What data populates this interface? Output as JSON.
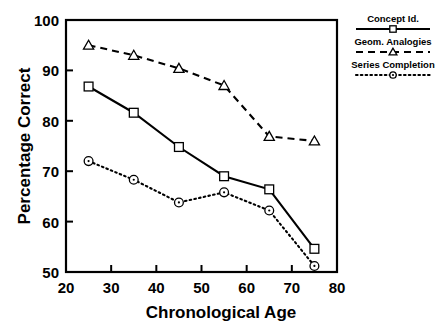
{
  "chart_data": {
    "type": "line",
    "title": "",
    "xlabel": "Chronological Age",
    "ylabel": "Percentage Correct",
    "xlim": [
      20,
      80
    ],
    "ylim": [
      50,
      100
    ],
    "xticks": [
      20,
      30,
      40,
      50,
      60,
      70,
      80
    ],
    "yticks": [
      50,
      60,
      70,
      80,
      90,
      100
    ],
    "xtick_labels": [
      "20",
      "30",
      "40",
      "50",
      "60",
      "70",
      "80"
    ],
    "ytick_labels": [
      "50",
      "60",
      "70",
      "80",
      "90",
      "100"
    ],
    "grid": false,
    "legend_position": "outside-right-top",
    "x": [
      25,
      35,
      45,
      55,
      65,
      75
    ],
    "series": [
      {
        "name": "Concept Id.",
        "marker": "square",
        "linestyle": "solid",
        "color": "#000000",
        "values": [
          86.8,
          81.6,
          74.8,
          69.0,
          66.4,
          54.6
        ]
      },
      {
        "name": "Geom. Analogies",
        "marker": "triangle",
        "linestyle": "dashed",
        "color": "#000000",
        "values": [
          95.0,
          93.0,
          90.4,
          87.0,
          76.9,
          76.0
        ]
      },
      {
        "name": "Series Completion",
        "marker": "circle",
        "linestyle": "dotted",
        "color": "#000000",
        "values": [
          72.0,
          68.3,
          63.8,
          65.8,
          62.2,
          51.2
        ]
      }
    ]
  },
  "legend": {
    "entries": [
      {
        "label": "Concept Id.",
        "style": "solid",
        "marker": "square"
      },
      {
        "label": "Geom. Analogies",
        "style": "dashed",
        "marker": "triangle"
      },
      {
        "label": "Series Completion",
        "style": "dotted",
        "marker": "circle"
      }
    ]
  },
  "colors": {
    "ink": "#000000",
    "background": "#ffffff"
  }
}
